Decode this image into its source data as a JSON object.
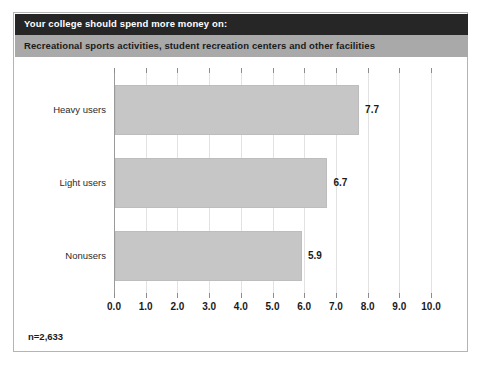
{
  "figure": {
    "title": "Your college should spend more money on:",
    "subtitle": "Recreational sports activities, student recreation centers and other facilities",
    "footnote": "n=2,633",
    "colors": {
      "title_bar": "#262626",
      "title_text": "#ffffff",
      "subtitle_bar": "#a9a9a9",
      "subtitle_text": "#1a1a1a",
      "bar_fill": "#c6c6c6",
      "bar_border": "#bdbdbd",
      "gridline": "#e2e2e2",
      "axis": "#9a9a9a",
      "frame_border": "#b4b4b4",
      "background": "#ffffff"
    }
  },
  "chart_data": {
    "type": "bar",
    "orientation": "horizontal",
    "title": "Your college should spend more money on:",
    "subtitle": "Recreational sports activities, student recreation centers and other facilities",
    "categories": [
      "Heavy users",
      "Light users",
      "Nonusers"
    ],
    "values": [
      7.7,
      6.7,
      5.9
    ],
    "data_labels": [
      "7.7",
      "6.7",
      "5.9"
    ],
    "xlabel": "",
    "ylabel": "",
    "xlim": [
      0.0,
      10.0
    ],
    "xticks": [
      0.0,
      1.0,
      2.0,
      3.0,
      4.0,
      5.0,
      6.0,
      7.0,
      8.0,
      9.0,
      10.0
    ],
    "xtick_labels": [
      "0.0",
      "1.0",
      "2.0",
      "3.0",
      "4.0",
      "5.0",
      "6.0",
      "7.0",
      "8.0",
      "9.0",
      "10.0"
    ],
    "grid": true,
    "grid_axis": "x",
    "legend": false,
    "sample_size_note": "n=2,633",
    "series": [
      {
        "name": "Mean rating",
        "values": [
          7.7,
          6.7,
          5.9
        ]
      }
    ]
  }
}
